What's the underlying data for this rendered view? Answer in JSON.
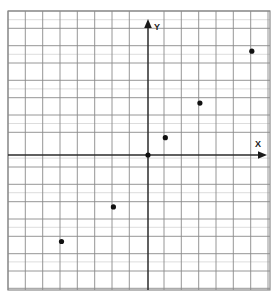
{
  "chart_data": {
    "type": "scatter",
    "title": "",
    "subtitle": "",
    "xlabel": "X",
    "ylabel": "Y",
    "grid": true,
    "legend": "none",
    "grid_step": 1,
    "xlim": [
      -8,
      7
    ],
    "ylim": [
      -8,
      8
    ],
    "tick_labels": {
      "x": [],
      "y": []
    },
    "annotations": [],
    "series": [
      {
        "name": "points",
        "marker": "filled-circle",
        "color": "#111111",
        "points": [
          {
            "x": -5,
            "y": -5
          },
          {
            "x": -2,
            "y": -3
          },
          {
            "x": 1,
            "y": 1
          },
          {
            "x": 3,
            "y": 3
          },
          {
            "x": 6,
            "y": 6
          }
        ]
      }
    ],
    "origin_marker": {
      "x": 0,
      "y": 0,
      "label": ""
    }
  },
  "axes": {
    "x_axis_label": "X",
    "y_axis_label": "Y",
    "x_arrow": "arrow-right",
    "y_arrow": "arrow-up"
  },
  "colors": {
    "grid_line": "#8a8a8a",
    "grid_line_light": "#b9b9b9",
    "axis_line": "#2b2b2b",
    "frame": "#8a8a8a",
    "point": "#111111",
    "background": "#ffffff",
    "label_text": "#1a1a1a"
  }
}
